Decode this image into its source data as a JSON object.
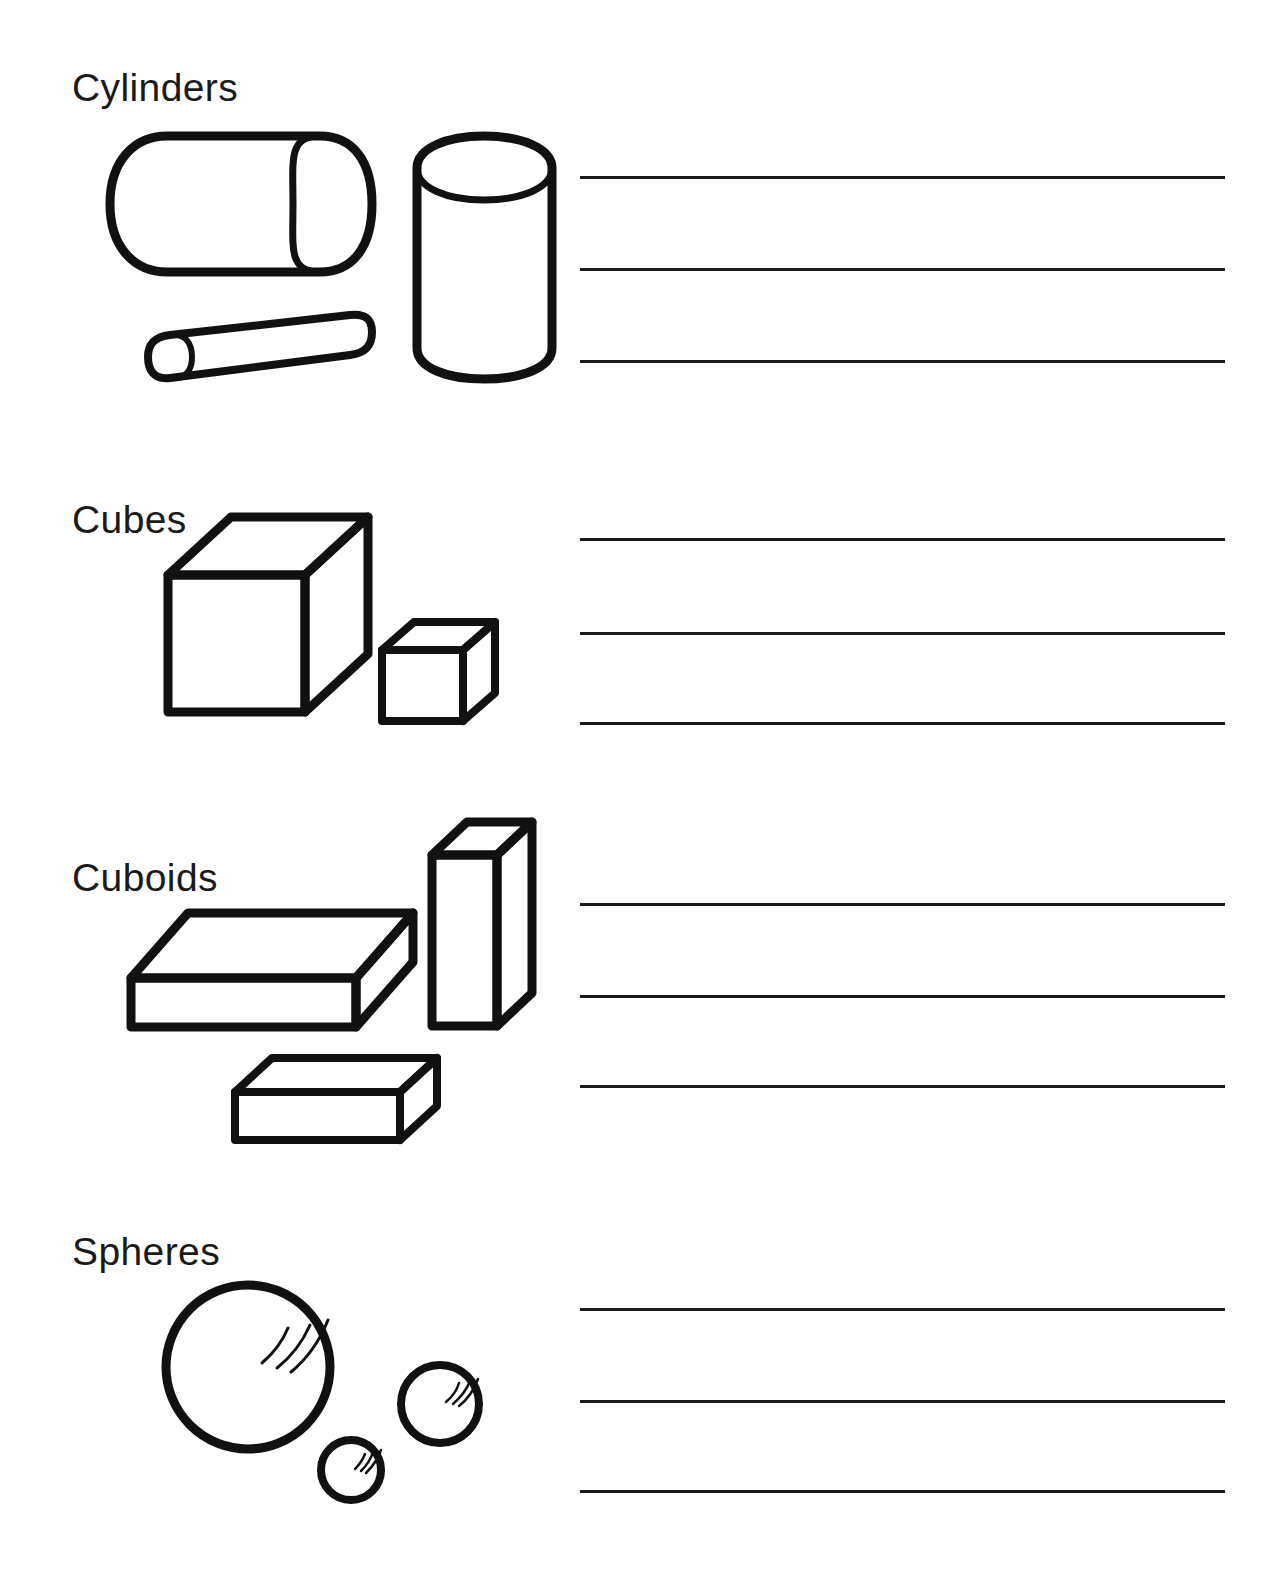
{
  "page": {
    "background_color": "#ffffff",
    "ink_color": "#1a1a1a",
    "width": 1280,
    "height": 1583
  },
  "sections": [
    {
      "id": "cylinders",
      "heading": "Cylinders",
      "heading_x": 72,
      "heading_y": 68,
      "shapes": [
        {
          "name": "horizontal-cylinder",
          "label": "horizontal cylinder"
        },
        {
          "name": "vertical-cylinder",
          "label": "vertical cylinder"
        },
        {
          "name": "thin-rod-cylinder",
          "label": "thin tilted rod cylinder"
        }
      ],
      "lines": [
        {
          "x1": 580,
          "x2": 1225,
          "y": 176
        },
        {
          "x1": 580,
          "x2": 1225,
          "y": 268
        },
        {
          "x1": 580,
          "x2": 1225,
          "y": 360
        }
      ]
    },
    {
      "id": "cubes",
      "heading": "Cubes",
      "heading_x": 72,
      "heading_y": 500,
      "shapes": [
        {
          "name": "large-cube",
          "label": "large cube"
        },
        {
          "name": "small-cube",
          "label": "small cube"
        }
      ],
      "lines": [
        {
          "x1": 580,
          "x2": 1225,
          "y": 538
        },
        {
          "x1": 580,
          "x2": 1225,
          "y": 632
        },
        {
          "x1": 580,
          "x2": 1225,
          "y": 722
        }
      ]
    },
    {
      "id": "cuboids",
      "heading": "Cuboids",
      "heading_x": 72,
      "heading_y": 858,
      "shapes": [
        {
          "name": "flat-slab-cuboid",
          "label": "large flat slab cuboid"
        },
        {
          "name": "tall-upright-cuboid",
          "label": "tall upright cuboid"
        },
        {
          "name": "small-brick-cuboid",
          "label": "small brick cuboid"
        }
      ],
      "lines": [
        {
          "x1": 580,
          "x2": 1225,
          "y": 903
        },
        {
          "x1": 580,
          "x2": 1225,
          "y": 995
        },
        {
          "x1": 580,
          "x2": 1225,
          "y": 1085
        }
      ]
    },
    {
      "id": "spheres",
      "heading": "Spheres",
      "heading_x": 72,
      "heading_y": 1232,
      "shapes": [
        {
          "name": "large-sphere",
          "label": "large sphere"
        },
        {
          "name": "medium-sphere",
          "label": "medium sphere"
        },
        {
          "name": "small-sphere",
          "label": "small sphere"
        }
      ],
      "lines": [
        {
          "x1": 580,
          "x2": 1225,
          "y": 1308
        },
        {
          "x1": 580,
          "x2": 1225,
          "y": 1400
        },
        {
          "x1": 580,
          "x2": 1225,
          "y": 1490
        }
      ]
    }
  ]
}
